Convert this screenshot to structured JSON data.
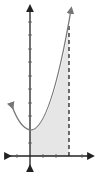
{
  "diagram": {
    "type": "area-under-curve",
    "curve": "parabola opening upward",
    "shaded_region": {
      "from_x": 0,
      "to_x": 3,
      "color": "#e6e6e6"
    },
    "boundary_line": {
      "x": 3,
      "style": "dashed"
    },
    "axis_color": "#222222",
    "curve_color": "#777777",
    "x_ticks": [
      -3,
      -1,
      1,
      2,
      3,
      4
    ],
    "y_tick_count": 9
  }
}
